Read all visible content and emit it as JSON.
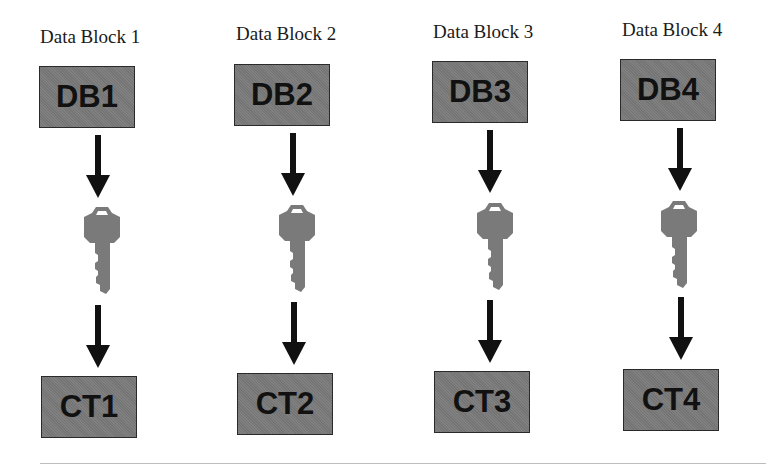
{
  "diagram": {
    "type": "block-encryption-flow",
    "colors": {
      "box_fill": "#7a7a7a",
      "box_border": "#2a2a2a",
      "box_text": "#111111",
      "arrow": "#111111",
      "key": "#7a7a7a",
      "label_text": "#1a1a1a"
    },
    "columns": [
      {
        "label": "Data Block 1",
        "data_block": "DB1",
        "key_icon": "key-icon",
        "ciphertext": "CT1"
      },
      {
        "label": "Data Block 2",
        "data_block": "DB2",
        "key_icon": "key-icon",
        "ciphertext": "CT2"
      },
      {
        "label": "Data Block 3",
        "data_block": "DB3",
        "key_icon": "key-icon",
        "ciphertext": "CT3"
      },
      {
        "label": "Data Block 4",
        "data_block": "DB4",
        "key_icon": "key-icon",
        "ciphertext": "CT4"
      }
    ]
  }
}
